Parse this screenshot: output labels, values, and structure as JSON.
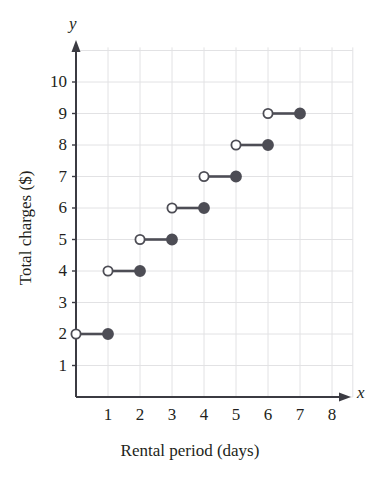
{
  "figure": {
    "axis_name_x": "x",
    "axis_name_y": "y",
    "x_axis_title": "Rental period (days)",
    "y_axis_title": "Total charges ($)"
  },
  "colors": {
    "marker": "#4d4d55",
    "segment": "#4d4d55",
    "grid": "#e2e2e4",
    "axis": "#3b3b42",
    "text": "#231f20",
    "open_fill": "#ffffff"
  },
  "chart_data": {
    "type": "line",
    "subtype": "step-function",
    "title": "",
    "xlabel": "Rental period (days)",
    "ylabel": "Total charges ($)",
    "xlim": [
      0,
      8.7
    ],
    "ylim": [
      0,
      11
    ],
    "grid": true,
    "legend": "none",
    "x_ticks": [
      1,
      2,
      3,
      4,
      5,
      6,
      7,
      8
    ],
    "y_ticks": [
      1,
      2,
      3,
      4,
      5,
      6,
      7,
      8,
      9,
      10
    ],
    "x_tick_labels": [
      "1",
      "2",
      "3",
      "4",
      "5",
      "6",
      "7",
      "8"
    ],
    "y_tick_labels": [
      "1",
      "2",
      "3",
      "4",
      "5",
      "6",
      "7",
      "8",
      "9",
      "10"
    ],
    "steps": [
      {
        "x_start": 0,
        "x_end": 1,
        "y": 2,
        "left_endpoint": "open",
        "right_endpoint": "closed"
      },
      {
        "x_start": 1,
        "x_end": 2,
        "y": 4,
        "left_endpoint": "open",
        "right_endpoint": "closed"
      },
      {
        "x_start": 2,
        "x_end": 3,
        "y": 5,
        "left_endpoint": "open",
        "right_endpoint": "closed"
      },
      {
        "x_start": 3,
        "x_end": 4,
        "y": 6,
        "left_endpoint": "open",
        "right_endpoint": "closed"
      },
      {
        "x_start": 4,
        "x_end": 5,
        "y": 7,
        "left_endpoint": "open",
        "right_endpoint": "closed"
      },
      {
        "x_start": 5,
        "x_end": 6,
        "y": 8,
        "left_endpoint": "open",
        "right_endpoint": "closed"
      },
      {
        "x_start": 6,
        "x_end": 7,
        "y": 9,
        "left_endpoint": "open",
        "right_endpoint": "closed"
      }
    ]
  }
}
